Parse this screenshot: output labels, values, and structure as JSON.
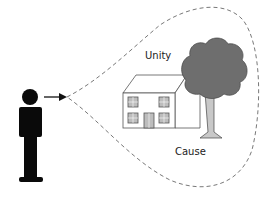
{
  "labels": {
    "unity": "Unity",
    "cause": "Cause"
  },
  "colors": {
    "figure": "#0a0a0a",
    "tree_canopy": "#6e6e6e",
    "tree_trunk": "#c8c8c8",
    "house_fill": "#ffffff",
    "window": "#bdbdbd",
    "line": "#555555"
  },
  "elements": [
    "person",
    "arrow",
    "dashed-field-of-view",
    "house",
    "tree"
  ]
}
